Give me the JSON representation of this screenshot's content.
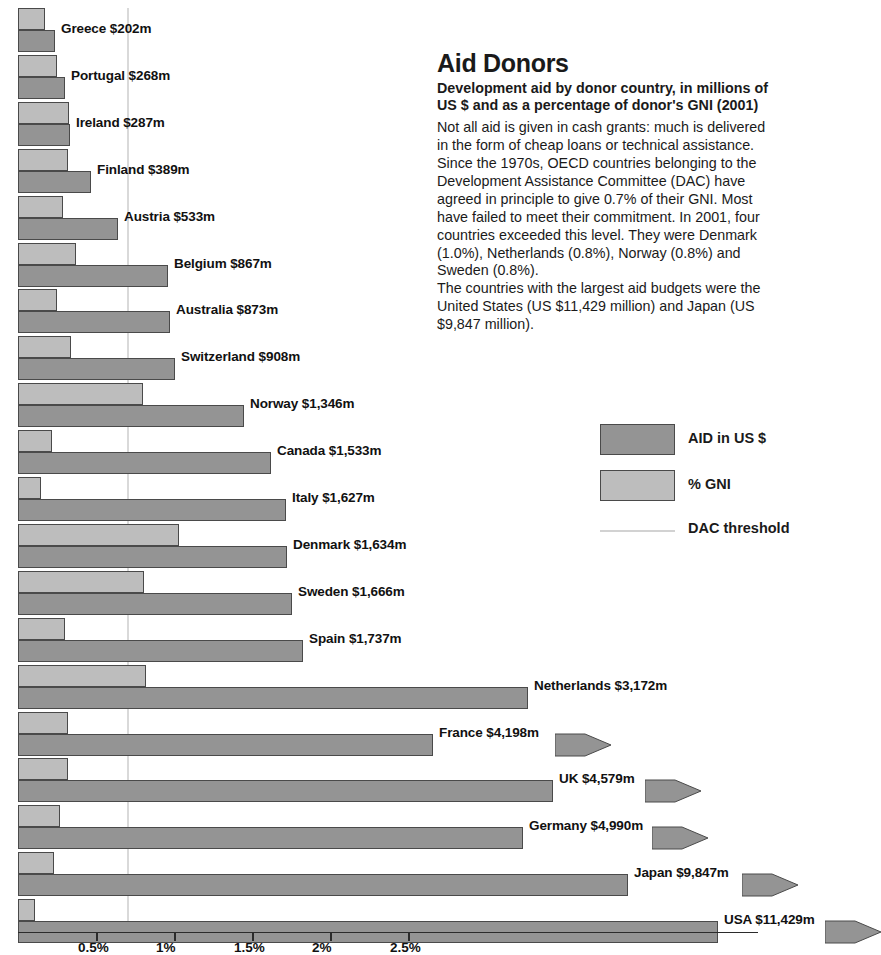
{
  "info": {
    "title": "Aid Donors",
    "subtitle": "Development aid by donor country, in millions of US $ and as a percentage of donor's GNI (2001)",
    "body": "Not all aid is given in cash grants: much is delivered in the form of cheap loans or technical assistance. Since the 1970s, OECD countries belonging to the Development Assistance Committee (DAC) have agreed in principle to give 0.7% of their GNI. Most have failed to meet their commitment. In 2001, four countries exceeded this level. They were Denmark (1.0%), Netherlands (0.8%), Norway (0.8%) and Sweden (0.8%).",
    "body2": "The countries with the largest aid budgets were the United States (US $11,429 million) and Japan (US $9,847 million)."
  },
  "legend": {
    "aid_label": "AID in US $",
    "gni_label": "% GNI",
    "threshold_label": "DAC threshold",
    "aid_color": "#949494",
    "gni_color": "#bdbdbd",
    "threshold_color": "#d2d2d2"
  },
  "chart_data": {
    "type": "bar",
    "title": "Aid Donors",
    "subtitle": "Development aid by donor country, in millions of US $ and as a percentage of donor's GNI (2001)",
    "orientation": "horizontal",
    "xlabel": "",
    "ylabel": "",
    "grid": false,
    "legend_position": "right",
    "xticks": [
      "0.5%",
      "1%",
      "1.5%",
      "2%",
      "2.5%"
    ],
    "xtick_values": [
      0.5,
      1,
      1.5,
      2,
      2.5
    ],
    "xlim": [
      0,
      4.75
    ],
    "dac_threshold_percent": 0.7,
    "aid_unit": "US $ millions",
    "gni_unit": "percent of GNI",
    "series": [
      {
        "name": "AID in US $",
        "color": "#949494"
      },
      {
        "name": "% GNI",
        "color": "#bdbdbd"
      }
    ],
    "categories": [
      "Greece",
      "Portugal",
      "Ireland",
      "Finland",
      "Austria",
      "Belgium",
      "Australia",
      "Switzerland",
      "Norway",
      "Canada",
      "Italy",
      "Denmark",
      "Sweden",
      "Spain",
      "Netherlands",
      "France",
      "UK",
      "Germany",
      "Japan",
      "USA"
    ],
    "rows": [
      {
        "country": "Greece",
        "label": "Greece $202m",
        "aid": 202,
        "gni": 0.17,
        "offscale": false
      },
      {
        "country": "Portugal",
        "label": "Portugal $268m",
        "aid": 268,
        "gni": 0.25,
        "offscale": false
      },
      {
        "country": "Ireland",
        "label": "Ireland $287m",
        "aid": 287,
        "gni": 0.33,
        "offscale": false
      },
      {
        "country": "Finland",
        "label": "Finland $389m",
        "aid": 389,
        "gni": 0.32,
        "offscale": false
      },
      {
        "country": "Austria",
        "label": "Austria $533m",
        "aid": 533,
        "gni": 0.29,
        "offscale": false
      },
      {
        "country": "Belgium",
        "label": "Belgium $867m",
        "aid": 867,
        "gni": 0.37,
        "offscale": false
      },
      {
        "country": "Australia",
        "label": "Australia $873m",
        "aid": 873,
        "gni": 0.25,
        "offscale": false
      },
      {
        "country": "Switzerland",
        "label": "Switzerland $908m",
        "aid": 908,
        "gni": 0.34,
        "offscale": false
      },
      {
        "country": "Norway",
        "label": "Norway $1,346m",
        "aid": 1346,
        "gni": 0.8,
        "offscale": false
      },
      {
        "country": "Canada",
        "label": "Canada $1,533m",
        "aid": 1533,
        "gni": 0.22,
        "offscale": false
      },
      {
        "country": "Italy",
        "label": "Italy $1,627m",
        "aid": 1627,
        "gni": 0.15,
        "offscale": false
      },
      {
        "country": "Denmark",
        "label": "Denmark $1,634m",
        "aid": 1634,
        "gni": 1.03,
        "offscale": false
      },
      {
        "country": "Sweden",
        "label": "Sweden $1,666m",
        "aid": 1666,
        "gni": 0.81,
        "offscale": false
      },
      {
        "country": "Spain",
        "label": "Spain $1,737m",
        "aid": 1737,
        "gni": 0.3,
        "offscale": false
      },
      {
        "country": "Netherlands",
        "label": "Netherlands $3,172m",
        "aid": 3172,
        "gni": 0.82,
        "offscale": false
      },
      {
        "country": "France",
        "label": "France $4,198m",
        "aid": 4198,
        "gni": 0.32,
        "offscale": true
      },
      {
        "country": "UK",
        "label": "UK $4,579m",
        "aid": 4579,
        "gni": 0.32,
        "offscale": true
      },
      {
        "country": "Germany",
        "label": "Germany $4,990m",
        "aid": 4990,
        "gni": 0.27,
        "offscale": true
      },
      {
        "country": "Japan",
        "label": "Japan $9,847m",
        "aid": 9847,
        "gni": 0.23,
        "offscale": true
      },
      {
        "country": "USA",
        "label": "USA $11,429m",
        "aid": 11429,
        "gni": 0.11,
        "offscale": true
      }
    ]
  }
}
